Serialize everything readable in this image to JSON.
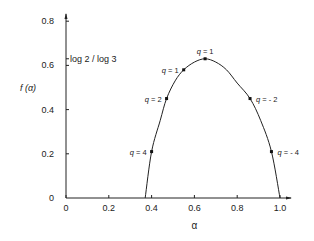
{
  "chart_data": {
    "type": "line",
    "title": "",
    "xlabel": "α",
    "ylabel": "f (α)",
    "xlim": [
      0,
      1.05
    ],
    "ylim": [
      0,
      0.82
    ],
    "grid": false,
    "x_ticks": [
      0,
      0.2,
      0.4,
      0.6,
      0.8,
      1.0
    ],
    "x_tick_labels": [
      "0",
      "0.2",
      "0.4",
      "0.6",
      "0.8",
      "1.0"
    ],
    "y_ticks": [
      0,
      0.2,
      0.4,
      0.6,
      0.8
    ],
    "y_tick_labels": [
      "0",
      "0.2",
      "0.4",
      "0.6",
      "0.8"
    ],
    "y_annotation": {
      "value": 0.63,
      "label": "log 2 / log 3"
    },
    "curve": {
      "x": [
        0.37,
        0.4,
        0.44,
        0.47,
        0.51,
        0.55,
        0.6,
        0.65,
        0.7,
        0.75,
        0.8,
        0.86,
        0.91,
        0.96,
        1.0
      ],
      "y": [
        0.0,
        0.21,
        0.35,
        0.45,
        0.53,
        0.58,
        0.615,
        0.63,
        0.615,
        0.58,
        0.52,
        0.45,
        0.35,
        0.21,
        0.0
      ]
    },
    "points": [
      {
        "alpha": 0.4,
        "f": 0.21,
        "label": "q = 4",
        "side": "left"
      },
      {
        "alpha": 0.47,
        "f": 0.45,
        "label": "q = 2",
        "side": "left"
      },
      {
        "alpha": 0.55,
        "f": 0.58,
        "label": "q = 1",
        "side": "left"
      },
      {
        "alpha": 0.65,
        "f": 0.63,
        "label": "q = 1",
        "side": "top"
      },
      {
        "alpha": 0.86,
        "f": 0.45,
        "label": "q = - 2",
        "side": "right"
      },
      {
        "alpha": 0.96,
        "f": 0.21,
        "label": "q = - 4",
        "side": "right"
      }
    ]
  }
}
